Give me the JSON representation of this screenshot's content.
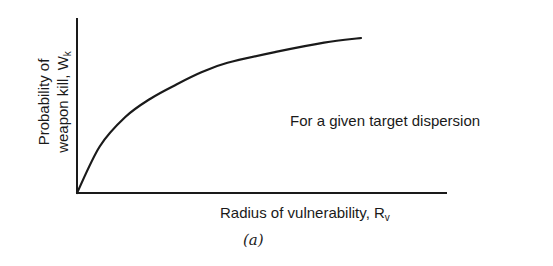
{
  "chart_data": {
    "type": "line",
    "title": "",
    "caption": "(a)",
    "xlabel": "Radius of vulnerability, R",
    "xlabel_sub": "v",
    "ylabel_line1": "Probability of",
    "ylabel_line2": "weapon kill, W",
    "ylabel_sub": "k",
    "annotation": "For a given target dispersion",
    "grid": false,
    "ticks": false,
    "series": [
      {
        "name": "Probability of weapon kill vs radius of vulnerability",
        "description": "Concave increasing curve starting at origin, saturating toward a maximum",
        "x": [
          0,
          0.08,
          0.17,
          0.26,
          0.35,
          0.44,
          0.53,
          0.7,
          0.87,
          1.0
        ],
        "y": [
          0,
          0.3,
          0.49,
          0.61,
          0.7,
          0.78,
          0.84,
          0.91,
          0.97,
          1.0
        ]
      }
    ],
    "xlim": [
      0,
      1.3
    ],
    "ylim": [
      0,
      1.1
    ]
  },
  "colors": {
    "ink": "#1a1a1a",
    "background": "#ffffff"
  }
}
